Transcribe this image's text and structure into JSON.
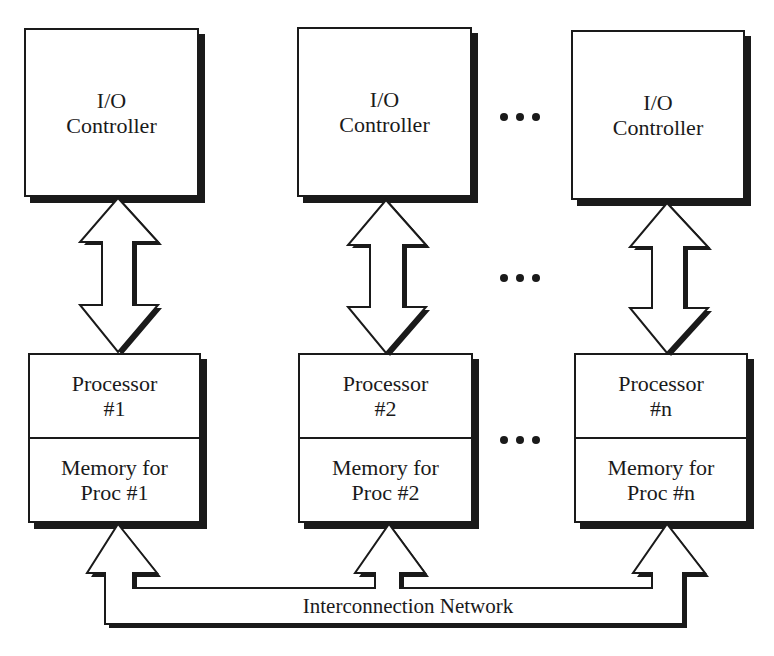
{
  "diagram": {
    "nodes": {
      "io": [
        {
          "line1": "I/O",
          "line2": "Controller"
        },
        {
          "line1": "I/O",
          "line2": "Controller"
        },
        {
          "line1": "I/O",
          "line2": "Controller"
        }
      ],
      "proc": [
        {
          "proc_line1": "Processor",
          "proc_line2": "#1",
          "mem_line1": "Memory for",
          "mem_line2": "Proc #1"
        },
        {
          "proc_line1": "Processor",
          "proc_line2": "#2",
          "mem_line1": "Memory for",
          "mem_line2": "Proc #2"
        },
        {
          "proc_line1": "Processor",
          "proc_line2": "#n",
          "mem_line1": "Memory for",
          "mem_line2": "Proc #n"
        }
      ]
    },
    "network": {
      "label": "Interconnection Network"
    },
    "ellipsis": {
      "symbol": "•••"
    },
    "edges": [
      {
        "from": "I/O Controller 1",
        "to": "Processor #1",
        "type": "bidirectional"
      },
      {
        "from": "I/O Controller 2",
        "to": "Processor #2",
        "type": "bidirectional"
      },
      {
        "from": "I/O Controller n",
        "to": "Processor #n",
        "type": "bidirectional"
      },
      {
        "from": "Interconnection Network",
        "to": "Memory for Proc #1",
        "type": "unidirectional"
      },
      {
        "from": "Interconnection Network",
        "to": "Memory for Proc #2",
        "type": "unidirectional"
      },
      {
        "from": "Interconnection Network",
        "to": "Memory for Proc #n",
        "type": "unidirectional"
      }
    ],
    "colors": {
      "ink": "#1a1a1a",
      "background": "#ffffff"
    }
  }
}
